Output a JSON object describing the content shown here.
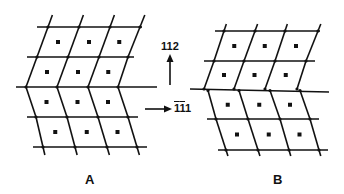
{
  "figure": {
    "panels": [
      {
        "id": "A",
        "label": "A"
      },
      {
        "id": "B",
        "label": "B"
      }
    ],
    "directions": {
      "up": {
        "label_digits": [
          "1",
          "1",
          "2"
        ],
        "overbar": [
          false,
          false,
          false
        ],
        "text": "112"
      },
      "right": {
        "label_digits": [
          "1",
          "1",
          "1"
        ],
        "overbar": [
          true,
          true,
          false
        ],
        "text": "1̄1̄1"
      }
    },
    "colors": {
      "line": "#111111",
      "background": "#ffffff"
    }
  },
  "lattice_A": {
    "rows": [
      {
        "y": 27,
        "x1": 37,
        "x2": 142,
        "nodes": [
          48,
          79,
          110,
          140
        ]
      },
      {
        "y": 57,
        "x1": 27,
        "x2": 134,
        "nodes": [
          37,
          68,
          99,
          128
        ]
      },
      {
        "y": 87,
        "x1": 16,
        "x2": 157,
        "nodes": [
          26,
          57,
          88,
          118
        ]
      },
      {
        "y": 117,
        "x1": 27,
        "x2": 138,
        "nodes": [
          36,
          67,
          98,
          128
        ]
      },
      {
        "y": 147,
        "x1": 33,
        "x2": 147,
        "nodes": [
          43,
          75,
          107,
          137
        ]
      }
    ],
    "top_ext": 12,
    "bottom_ext": 8
  },
  "lattice_B": {
    "rows": [
      {
        "y": 31,
        "x1": 215,
        "x2": 320,
        "nodes": [
          224,
          255,
          285,
          318
        ]
      },
      {
        "y": 61,
        "x1": 204,
        "x2": 315,
        "nodes": [
          214,
          244,
          275,
          306
        ]
      },
      {
        "y": 89,
        "x1": 190,
        "x2": 329,
        "y2": 92,
        "nodes_upper": [
          204,
          234,
          265,
          297
        ],
        "nodes_lower": [
          208,
          239,
          270,
          300
        ]
      },
      {
        "y": 119,
        "x1": 207,
        "x2": 319,
        "nodes": [
          216,
          248,
          280,
          310
        ]
      },
      {
        "y": 150,
        "x1": 218,
        "x2": 328,
        "nodes": [
          226,
          258,
          289,
          319
        ]
      }
    ],
    "top_ext": 7,
    "bottom_ext": 6
  }
}
